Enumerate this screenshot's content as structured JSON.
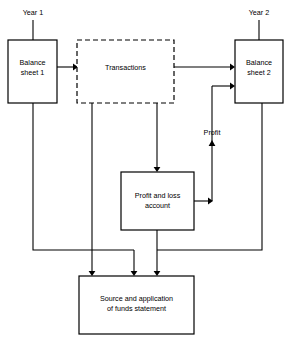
{
  "diagram": {
    "canvas": {
      "width": 290,
      "height": 344
    },
    "background_color": "#ffffff",
    "line_color": "#000000",
    "nodes": {
      "balance_sheet_1": {
        "label_line_1": "Balance",
        "label_line_2": "sheet 1",
        "border_style": "solid"
      },
      "transactions": {
        "label_line_1": "Transactions",
        "border_style": "dashed"
      },
      "balance_sheet_2": {
        "label_line_1": "Balance",
        "label_line_2": "sheet 2",
        "border_style": "solid"
      },
      "profit_and_loss_account": {
        "label_line_1": "Profit and loss",
        "label_line_2": "account",
        "border_style": "solid"
      },
      "funds_statement": {
        "label_line_1": "Source and application",
        "label_line_2": "of funds statement",
        "border_style": "solid"
      }
    },
    "annotations": {
      "year_1": "Year 1",
      "year_2": "Year 2",
      "profit": "Profit"
    }
  }
}
